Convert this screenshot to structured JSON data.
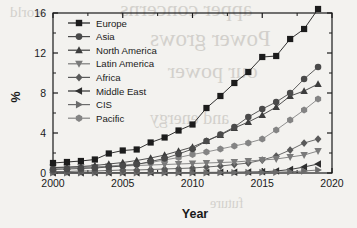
{
  "chart_data": {
    "type": "line",
    "title": "",
    "xlabel": "Year",
    "ylabel": "%",
    "xlim": [
      2000,
      2020
    ],
    "ylim": [
      0,
      16
    ],
    "xticks": [
      "2000",
      "2005",
      "2010",
      "2015",
      "2020"
    ],
    "yticks": [
      "0",
      "4",
      "8",
      "12",
      "16"
    ],
    "grid": false,
    "legend_position": "upper-left-inside",
    "x": [
      2000,
      2001,
      2002,
      2003,
      2004,
      2005,
      2006,
      2007,
      2008,
      2009,
      2010,
      2011,
      2012,
      2013,
      2014,
      2015,
      2016,
      2017,
      2018,
      2019
    ],
    "series": [
      {
        "name": "Europe",
        "marker": "square",
        "color": "#1c1c1c",
        "values": [
          1.0,
          1.1,
          1.2,
          1.35,
          1.95,
          2.25,
          2.35,
          3.05,
          3.55,
          4.25,
          4.85,
          6.5,
          7.7,
          9.0,
          10.1,
          11.6,
          11.7,
          13.4,
          14.4,
          16.4
        ]
      },
      {
        "name": "Asia",
        "marker": "circle",
        "color": "#4a4a4a",
        "values": [
          0.35,
          0.4,
          0.45,
          0.5,
          0.6,
          0.7,
          0.85,
          1.15,
          1.45,
          1.9,
          2.4,
          3.2,
          3.85,
          4.6,
          5.6,
          6.4,
          7.1,
          8.0,
          9.4,
          10.6
        ]
      },
      {
        "name": "North America",
        "marker": "triangle-up",
        "color": "#3d3d3d",
        "values": [
          0.55,
          0.6,
          0.65,
          0.75,
          0.9,
          1.05,
          1.25,
          1.5,
          1.8,
          2.2,
          2.6,
          3.2,
          3.8,
          4.5,
          5.1,
          5.8,
          6.6,
          7.7,
          8.2,
          8.9
        ]
      },
      {
        "name": "Latin America",
        "marker": "triangle-down",
        "color": "#7a7a7a",
        "values": [
          0.55,
          0.55,
          0.6,
          0.6,
          0.65,
          0.7,
          0.75,
          0.8,
          0.85,
          0.9,
          0.95,
          1.0,
          1.05,
          1.1,
          1.2,
          1.3,
          1.4,
          1.6,
          1.8,
          2.2
        ]
      },
      {
        "name": "Africa",
        "marker": "diamond",
        "color": "#5a5a5a",
        "values": [
          0.15,
          0.15,
          0.2,
          0.2,
          0.25,
          0.3,
          0.3,
          0.35,
          0.4,
          0.45,
          0.5,
          0.6,
          0.7,
          0.85,
          1.0,
          1.3,
          1.7,
          2.3,
          3.0,
          3.4
        ]
      },
      {
        "name": "Middle East",
        "marker": "triangle-left",
        "color": "#2e2e2e",
        "values": [
          0.02,
          0.02,
          0.02,
          0.02,
          0.03,
          0.03,
          0.03,
          0.04,
          0.04,
          0.05,
          0.05,
          0.06,
          0.07,
          0.08,
          0.1,
          0.12,
          0.2,
          0.35,
          0.6,
          0.9
        ]
      },
      {
        "name": "CIS",
        "marker": "triangle-right",
        "color": "#6b6b6b",
        "values": [
          0.01,
          0.01,
          0.01,
          0.01,
          0.02,
          0.02,
          0.02,
          0.02,
          0.02,
          0.03,
          0.03,
          0.03,
          0.04,
          0.04,
          0.05,
          0.06,
          0.08,
          0.12,
          0.2,
          0.3
        ]
      },
      {
        "name": "Pacific",
        "marker": "hexagon",
        "color": "#848484",
        "values": [
          0.45,
          0.5,
          0.55,
          0.6,
          0.7,
          0.8,
          0.9,
          1.05,
          1.3,
          1.55,
          1.85,
          2.1,
          2.4,
          2.7,
          3.0,
          3.4,
          4.3,
          5.3,
          6.3,
          7.4
        ]
      }
    ]
  },
  "background_text": {
    "line1": "apper concerns",
    "line2": "Power grows",
    "line3": "our power",
    "line4": "and energy",
    "line5": "future",
    "line6": "world"
  }
}
